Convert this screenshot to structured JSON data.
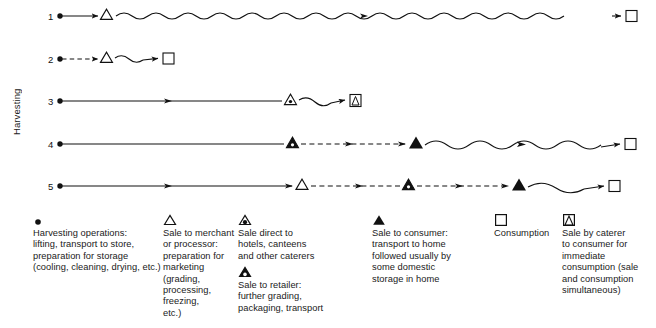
{
  "axis": {
    "label": "Harvesting"
  },
  "rows": [
    {
      "number": "1",
      "name": "chain-1",
      "description": "Harvesting operations, sale to merchant or processor, long storage, consumption",
      "nodes": [
        "harvesting-dot",
        "open-triangle",
        "square"
      ],
      "links": [
        "solid-arrow",
        "wavy-arrow"
      ]
    },
    {
      "number": "2",
      "name": "chain-2",
      "description": "Harvesting operations, sale to merchant or processor, short storage, consumption",
      "nodes": [
        "harvesting-dot",
        "open-triangle",
        "square"
      ],
      "links": [
        "dashed-arrow",
        "wavy-arrow"
      ]
    },
    {
      "number": "3",
      "name": "chain-3",
      "description": "Harvesting operations, sale direct to hotels and caterers, sale by caterer for immediate consumption",
      "nodes": [
        "harvesting-dot",
        "triangle-dot",
        "square-triangle"
      ],
      "links": [
        "solid-arrow",
        "wavy-arrow"
      ]
    },
    {
      "number": "4",
      "name": "chain-4",
      "description": "Harvesting operations, sale to retailer, sale to consumer, domestic storage, consumption",
      "nodes": [
        "harvesting-dot",
        "triangle-dot",
        "filled-triangle",
        "square"
      ],
      "links": [
        "solid-arrow",
        "dashed-arrow",
        "wavy-arrow"
      ]
    },
    {
      "number": "5",
      "name": "chain-5",
      "description": "Harvesting operations, sale to merchant, sale to retailer, sale to consumer, consumption",
      "nodes": [
        "harvesting-dot",
        "open-triangle",
        "triangle-dot",
        "filled-triangle",
        "square"
      ],
      "links": [
        "solid-arrow",
        "dashed-arrow",
        "dashed-arrow",
        "wavy-arrow"
      ]
    }
  ],
  "legend": [
    {
      "symbol": "harvesting-dot",
      "text": "Harvesting operations:\nlifting, transport to store,\npreparation for storage\n(cooling, cleaning, drying, etc.)"
    },
    {
      "symbol": "open-triangle",
      "text": "Sale to merchant\nor processor:\npreparation for\nmarketing (grading,\nprocessing, freezing,\netc.)"
    },
    {
      "symbol": "triangle-dot",
      "text": "Sale direct to\nhotels, canteens\nand other caterers"
    },
    {
      "symbol": "triangle-dot-filled",
      "text": "Sale to retailer:\nfurther grading,\npackaging, transport"
    },
    {
      "symbol": "filled-triangle",
      "text": "Sale to consumer:\ntransport to home\nfollowed usually by\nsome domestic\nstorage in home"
    },
    {
      "symbol": "square",
      "text": "Consumption"
    },
    {
      "symbol": "square-triangle",
      "text": "Sale by caterer\nto consumer for\nimmediate\nconsumption (sale\nand consumption\nsimultaneous)"
    }
  ],
  "colors": {
    "ink": "#111111",
    "background": "#ffffff"
  }
}
